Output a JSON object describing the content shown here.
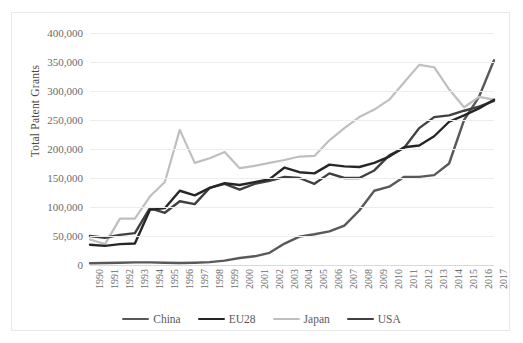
{
  "chart_data": {
    "type": "line",
    "title": "",
    "xlabel": "",
    "ylabel": "Total Patent Grants",
    "ylim": [
      0,
      400000
    ],
    "ytick_values": [
      0,
      50000,
      100000,
      150000,
      200000,
      250000,
      300000,
      350000,
      400000
    ],
    "ytick_labels": [
      "0",
      "50,000",
      "100,000",
      "150,000",
      "200,000",
      "250,000",
      "300,000",
      "350,000",
      "400,000"
    ],
    "grid": "horizontal",
    "legend_position": "bottom",
    "categories": [
      1990,
      1991,
      1992,
      1993,
      1994,
      1995,
      1996,
      1997,
      1998,
      1999,
      2000,
      2001,
      2002,
      2003,
      2004,
      2005,
      2006,
      2007,
      2008,
      2009,
      2010,
      2011,
      2012,
      2013,
      2014,
      2015,
      2016,
      2017
    ],
    "x": [
      "1990",
      "1991",
      "1992",
      "1993",
      "1994",
      "1995",
      "1996",
      "1997",
      "1998",
      "1999",
      "2000",
      "2001",
      "2002",
      "2003",
      "2004",
      "2005",
      "2006",
      "2007",
      "2008",
      "2009",
      "2010",
      "2011",
      "2012",
      "2013",
      "2014",
      "2015",
      "2016",
      "2017"
    ],
    "series": [
      {
        "name": "China",
        "color": "#595959",
        "values": [
          3000,
          3500,
          4000,
          4500,
          4500,
          4000,
          3500,
          4000,
          5000,
          7500,
          12000,
          15000,
          21000,
          37000,
          49000,
          53000,
          58000,
          68000,
          94000,
          128000,
          135000,
          172000,
          217000,
          208000,
          233000,
          359000,
          404000,
          420000
        ]
      },
      {
        "name": "EU28",
        "color": "#262626",
        "values": [
          35000,
          33000,
          36000,
          37000,
          95000,
          98000,
          128000,
          120000,
          133000,
          141000,
          138000,
          143000,
          148000,
          168000,
          160000,
          158000,
          173000,
          170000,
          169000,
          176000,
          187000,
          203000,
          206000,
          222000,
          247000,
          258000,
          270000,
          285000
        ]
      },
      {
        "name": "Japan",
        "color": "#bfbfbf",
        "values": [
          44000,
          36000,
          80000,
          80000,
          118000,
          143000,
          233000,
          176000,
          184000,
          195000,
          167000,
          171000,
          176000,
          181000,
          187000,
          188000,
          215000,
          236000,
          255000,
          268000,
          285000,
          315000,
          345000,
          341000,
          303000,
          272000,
          290000,
          285000
        ]
      },
      {
        "name": "USA",
        "color": "#404040",
        "values": [
          50000,
          47000,
          52000,
          55000,
          98000,
          90000,
          110000,
          105000,
          133000,
          140000,
          130000,
          140000,
          145000,
          152000,
          150000,
          140000,
          158000,
          150000,
          150000,
          163000,
          189000,
          202000,
          236000,
          255000,
          258000,
          266000,
          273000,
          283000
        ]
      }
    ],
    "series_render_order": [
      "China",
      "Japan",
      "USA",
      "EU28"
    ],
    "china_note_values": [
      3000,
      3500,
      4000,
      4500,
      4500,
      4000,
      3500,
      4000,
      5000,
      7500,
      12000,
      15000,
      21000,
      37000,
      49000,
      53000,
      58000,
      68000,
      94000,
      128000,
      135000,
      152000,
      152000,
      155000,
      175000,
      250000,
      290000,
      353000
    ]
  },
  "legend": {
    "items": [
      {
        "label": "China",
        "color": "#595959"
      },
      {
        "label": "EU28",
        "color": "#262626"
      },
      {
        "label": "Japan",
        "color": "#bfbfbf"
      },
      {
        "label": "USA",
        "color": "#404040"
      }
    ]
  }
}
